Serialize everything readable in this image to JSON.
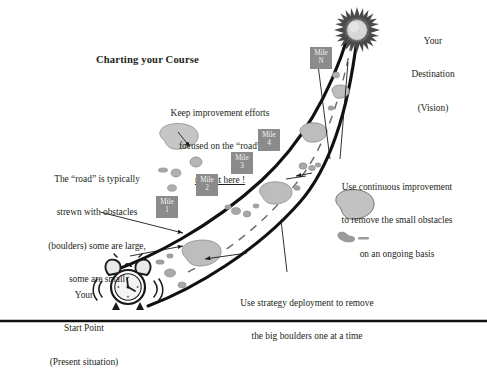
{
  "diagram": {
    "title": "Charting your Course",
    "type": "journey-roadmap-diagram",
    "background_color": "#ffffff",
    "ink_color": "#231f20",
    "road_color": "#111111",
    "marker_color": "#8b8b8b",
    "marker_text_color": "#f2f2f2",
    "boulder_color": "#b9b9b9",
    "boulder_outline": "#7d7d7d"
  },
  "labels": {
    "destination": "Your\nDestination\n(Vision)",
    "destination_lines": [
      "Your",
      "Destination",
      "(Vision)"
    ],
    "start_point": "Your\nStart Point\n(Present situation)",
    "start_point_lines": [
      "Your",
      "Start Point",
      "(Present situation)"
    ]
  },
  "notes": {
    "keep_focus": {
      "line1": "Keep improvement efforts",
      "line2": "focused on the “road”",
      "line3_underlined": "not out here !"
    },
    "road_obstacles": {
      "line1": "The “road” is typically",
      "line2": "strewn with obstacles",
      "line3": "(boulders) some are large,",
      "line4": "some are small"
    },
    "continuous_improvement": {
      "line1": "Use continuous improvement",
      "line2": "to remove the small obstacles",
      "line3": "on an ongoing basis"
    },
    "strategy_deployment": {
      "line1": "Use strategy deployment to remove",
      "line2": "the big boulders one at a time"
    }
  },
  "mile_markers": [
    {
      "id": "mile-1",
      "word": "Mile",
      "number": "1",
      "x": 156,
      "y": 196,
      "w": 22,
      "h": 22
    },
    {
      "id": "mile-2",
      "word": "Mile",
      "number": "2",
      "x": 196,
      "y": 174,
      "w": 22,
      "h": 22
    },
    {
      "id": "mile-3",
      "word": "Mile",
      "number": "3",
      "x": 231,
      "y": 152,
      "w": 22,
      "h": 22
    },
    {
      "id": "mile-4",
      "word": "Mile",
      "number": "4",
      "x": 258,
      "y": 129,
      "w": 22,
      "h": 22
    },
    {
      "id": "mile-n",
      "word": "Mile",
      "number": "N",
      "x": 310,
      "y": 47,
      "w": 22,
      "h": 22
    }
  ],
  "icons": {
    "destination": "sun-burst-icon",
    "start": "alarm-clock-icon"
  },
  "footer": {
    "rule": true
  }
}
